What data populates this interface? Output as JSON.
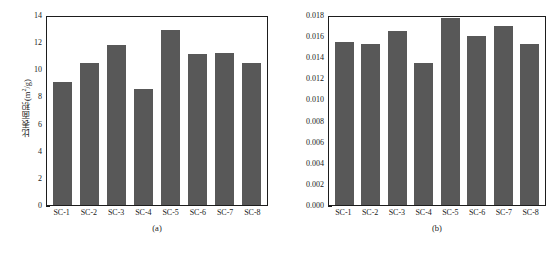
{
  "figure": {
    "background_color": "#ffffff",
    "bar_color": "#585858",
    "axis_color": "#1d1d1d"
  },
  "chart_data": [
    {
      "type": "bar",
      "panel": "a",
      "title": "",
      "caption": "(a)",
      "xlabel": "",
      "ylabel": "比表面积(m²/g)",
      "ylabel_text": "比表面积",
      "ylabel_unit_base": "(cm",
      "categories": [
        "SC-1",
        "SC-2",
        "SC-3",
        "SC-4",
        "SC-5",
        "SC-6",
        "SC-7",
        "SC-8"
      ],
      "values": [
        9.1,
        10.45,
        11.8,
        8.55,
        12.9,
        11.1,
        11.2,
        10.5
      ],
      "ylim": [
        0,
        14
      ],
      "yticks": [
        0,
        2,
        4,
        6,
        8,
        10,
        12,
        14
      ],
      "ytick_labels": [
        "0",
        "2",
        "4",
        "6",
        "8",
        "10",
        "12",
        "14"
      ],
      "grid": false,
      "legend": "none"
    },
    {
      "type": "bar",
      "panel": "b",
      "title": "",
      "caption": "(b)",
      "xlabel": "",
      "ylabel": "孔隙体积(cm³/g)",
      "ylabel_text": "孔隙体积",
      "categories": [
        "SC-1",
        "SC-2",
        "SC-3",
        "SC-4",
        "SC-5",
        "SC-6",
        "SC-7",
        "SC-8"
      ],
      "values": [
        0.0154,
        0.0153,
        0.0165,
        0.0135,
        0.0177,
        0.016,
        0.017,
        0.0153
      ],
      "ylim": [
        0,
        0.018
      ],
      "yticks": [
        0,
        0.002,
        0.004,
        0.006,
        0.008,
        0.01,
        0.012,
        0.014,
        0.016,
        0.018
      ],
      "ytick_labels": [
        "0.000",
        "0.002",
        "0.004",
        "0.006",
        "0.008",
        "0.010",
        "0.012",
        "0.014",
        "0.016",
        "0.018"
      ],
      "grid": false,
      "legend": "none"
    }
  ]
}
